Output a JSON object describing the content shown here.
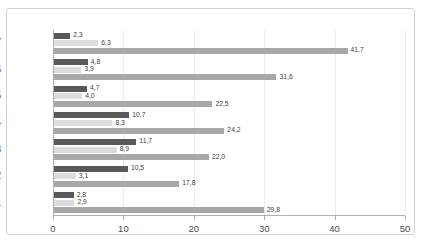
{
  "chart_data": {
    "type": "bar",
    "orientation": "horizontal",
    "title": "",
    "xlabel": "",
    "ylabel": "",
    "categories": [
      "2007",
      "2006",
      "2005",
      "2004",
      "2003",
      "2002",
      "2001"
    ],
    "series": [
      {
        "name": "series-1",
        "color": "#595959",
        "values": [
          2.3,
          4.8,
          4.7,
          10.7,
          11.7,
          10.5,
          2.8
        ],
        "labels": [
          "2,3",
          "4,8",
          "4,7",
          "10,7",
          "11,7",
          "10,5",
          "2,8"
        ]
      },
      {
        "name": "series-2",
        "color": "#dcdcdc",
        "values": [
          6.3,
          3.9,
          4.0,
          8.3,
          8.9,
          3.1,
          2.9
        ],
        "labels": [
          "6,3",
          "3,9",
          "4,0",
          "8,3",
          "8,9",
          "3,1",
          "2,9"
        ]
      },
      {
        "name": "series-3",
        "color": "#a8a8a8",
        "values": [
          41.7,
          31.6,
          22.5,
          24.2,
          22.0,
          17.8,
          29.8
        ],
        "labels": [
          "41,7",
          "31,6",
          "22,5",
          "24,2",
          "22,0",
          "17,8",
          "29,8"
        ]
      }
    ],
    "xticks": [
      0,
      10,
      20,
      30,
      40,
      50
    ],
    "xtick_labels": [
      "0",
      "10",
      "20",
      "30",
      "40",
      "50"
    ],
    "xlim": [
      0,
      50
    ],
    "grid": true,
    "legend": "none"
  }
}
